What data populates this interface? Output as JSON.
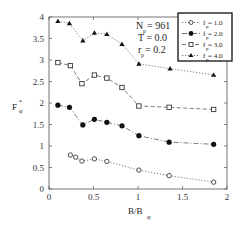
{
  "chart_data": {
    "type": "line",
    "title": "",
    "xlabel": "B/B_φ",
    "ylabel": "F_φ^*",
    "xlim": [
      0,
      2
    ],
    "ylim": [
      0,
      4
    ],
    "xticks": [
      0,
      0.5,
      1,
      1.5,
      2
    ],
    "yticks": [
      0,
      0.5,
      1,
      1.5,
      2,
      2.5,
      3,
      3.5,
      4
    ],
    "xtick_labels": [
      "0",
      "0.5",
      "1",
      "1.5",
      "2"
    ],
    "ytick_labels": [
      "0",
      "0.5",
      "1",
      "1.5",
      "2",
      "2.5",
      "3",
      "3.5",
      "4"
    ],
    "grid": false,
    "legend_position": "upper right",
    "annotations": [
      "N_p = 961",
      "T = 0.0",
      "r_p = 0.2"
    ],
    "series": [
      {
        "name": "f_p = 1.0",
        "marker": "open-circle",
        "line": "dotted",
        "x": [
          0.24,
          0.3,
          0.37,
          0.51,
          0.65,
          1.01,
          1.35,
          1.85
        ],
        "y": [
          0.79,
          0.74,
          0.65,
          0.7,
          0.64,
          0.44,
          0.31,
          0.16
        ]
      },
      {
        "name": "f_p = 2.0",
        "marker": "filled-circle",
        "line": "dash-dot",
        "x": [
          0.1,
          0.23,
          0.38,
          0.51,
          0.65,
          0.82,
          1.01,
          1.35,
          1.85
        ],
        "y": [
          1.95,
          1.9,
          1.49,
          1.62,
          1.55,
          1.47,
          1.24,
          1.09,
          1.04
        ]
      },
      {
        "name": "f_p = 3.0",
        "marker": "open-square",
        "line": "dashed",
        "x": [
          0.1,
          0.24,
          0.37,
          0.51,
          0.65,
          0.82,
          1.01,
          1.35,
          1.85
        ],
        "y": [
          2.94,
          2.87,
          2.45,
          2.65,
          2.58,
          2.36,
          1.93,
          1.9,
          1.85
        ]
      },
      {
        "name": "f_p = 4.0",
        "marker": "filled-triangle",
        "line": "dotted",
        "x": [
          0.1,
          0.23,
          0.38,
          0.51,
          0.65,
          0.82,
          1.01,
          1.36,
          1.85
        ],
        "y": [
          3.9,
          3.85,
          3.45,
          3.63,
          3.6,
          3.37,
          2.91,
          2.8,
          2.65
        ]
      }
    ]
  },
  "labels": {
    "ylabel_main": "F",
    "ylabel_sup": "*",
    "ylabel_sub": "φ",
    "xlabel_main": "B/B",
    "xlabel_sub": "φ",
    "ann_np_main": "N",
    "ann_np_sub": "p",
    "ann_np_val": " = 961",
    "ann_t": "T = 0.0",
    "ann_rp_main": "r",
    "ann_rp_sub": "p",
    "ann_rp_val": " = 0.2",
    "legend": [
      {
        "main": "f",
        "sub": "p",
        "val": " = 1.0"
      },
      {
        "main": "f",
        "sub": "p",
        "val": " = 2.0"
      },
      {
        "main": "f",
        "sub": "p",
        "val": " = 3.0"
      },
      {
        "main": "f",
        "sub": "p",
        "val": " = 4.0"
      }
    ]
  }
}
